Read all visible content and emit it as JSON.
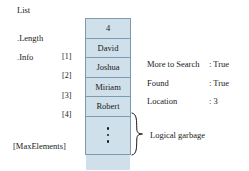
{
  "diagram": {
    "colors": {
      "cell_fill": "#cfe0ea",
      "cell_border": "#7d9bb0",
      "text": "#1a1a1a",
      "background": "#ffffff"
    },
    "labels": {
      "record_name": "List",
      "length_field": ".Length",
      "info_field": ".Info",
      "max_elements": "[MaxElements]",
      "garbage_caption": "Logical garbage"
    },
    "indices": [
      {
        "label": "[1]"
      },
      {
        "label": "[2]"
      },
      {
        "label": "[3]"
      },
      {
        "label": "[4]"
      }
    ],
    "cells": [
      {
        "name": "length-cell",
        "value": "4",
        "kind": "value"
      },
      {
        "name": "element-1",
        "value": "David",
        "kind": "value"
      },
      {
        "name": "element-2",
        "value": "Joshua",
        "kind": "value"
      },
      {
        "name": "element-3",
        "value": "Miriam",
        "kind": "value"
      },
      {
        "name": "element-4",
        "value": "Robert",
        "kind": "value"
      },
      {
        "name": "ellipsis-cell",
        "value": "",
        "kind": "dots"
      },
      {
        "name": "last-cell",
        "value": "",
        "kind": "empty"
      }
    ],
    "status": [
      {
        "key": "More to Search",
        "value": ": True"
      },
      {
        "key": "Found",
        "value": ": True"
      },
      {
        "key": "Location",
        "value": ": 3"
      }
    ]
  }
}
